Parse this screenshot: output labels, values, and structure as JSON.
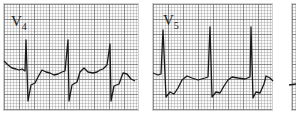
{
  "figure": {
    "type": "ecg-leads",
    "panels": [
      {
        "lead": "V",
        "subscript": "4"
      },
      {
        "lead": "V",
        "subscript": "5"
      },
      {
        "lead": "",
        "subscript": ""
      }
    ],
    "colors": {
      "grid_major": "#5a5a5a",
      "grid_minor": "#8c8c8c",
      "trace": "#1a1a1a",
      "paper": "#fafafa"
    }
  }
}
